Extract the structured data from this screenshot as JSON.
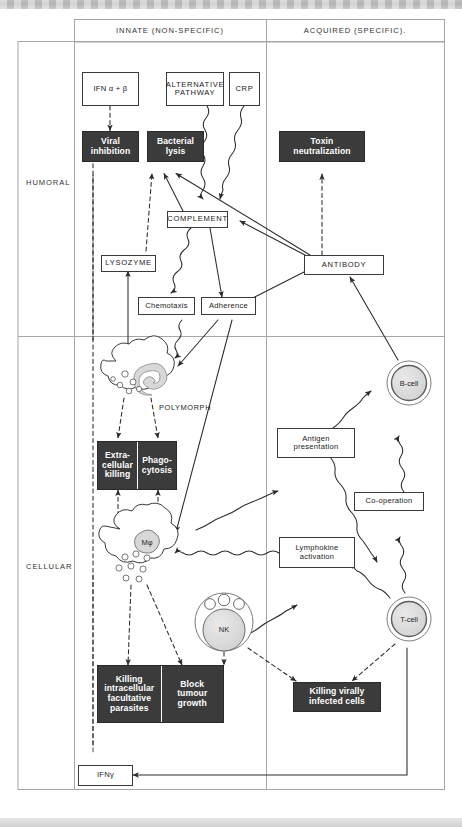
{
  "figure": {
    "type": "immunology-flow-diagram",
    "columns": [
      {
        "id": "innate",
        "label": "INNATE (NON-SPECIFIC)"
      },
      {
        "id": "acquired",
        "label": "ACQUIRED (SPECIFIC)."
      }
    ],
    "rows": [
      {
        "id": "humoral",
        "label": "HUMORAL"
      },
      {
        "id": "cellular",
        "label": "CELLULAR"
      }
    ],
    "colors": {
      "effector_fill": "#3b3b3b",
      "effector_text": "#ffffff",
      "mediator_fill": "#ffffff",
      "stroke": "#3a3a3a",
      "frame": "#9a9a9a",
      "cell_nucleus": "#d8d8d8"
    },
    "legend_note": {
      "solid_arrow": "activation / direct action",
      "dashed_arrow": "effector action",
      "wavy_arrow": "soluble mediator"
    },
    "nodes": {
      "ifn_ab": {
        "label": "IFN α + β",
        "style": "open",
        "compartment": "innate-humoral"
      },
      "alt_pathway": {
        "label": "ALTERNATIVE\nPATHWAY",
        "style": "open",
        "compartment": "innate-humoral"
      },
      "crp": {
        "label": "CRP",
        "style": "open",
        "compartment": "innate-humoral"
      },
      "viral_inhib": {
        "label": "Viral\ninhibition",
        "style": "solid",
        "compartment": "innate-humoral"
      },
      "bacterial_lysis": {
        "label": "Bacterial\nlysis",
        "style": "solid",
        "compartment": "innate-humoral"
      },
      "toxin_neut": {
        "label": "Toxin\nneutralization",
        "style": "solid",
        "compartment": "acquired-humoral"
      },
      "complement": {
        "label": "COMPLEMENT",
        "style": "open",
        "compartment": "innate-humoral"
      },
      "lysozyme": {
        "label": "LYSOZYME",
        "style": "open",
        "compartment": "innate-humoral"
      },
      "chemotaxis": {
        "label": "Chemotaxis",
        "style": "open",
        "compartment": "innate-humoral"
      },
      "adherence": {
        "label": "Adherence",
        "style": "open",
        "compartment": "innate-humoral"
      },
      "antibody": {
        "label": "ANTIBODY",
        "style": "open",
        "compartment": "acquired-humoral"
      },
      "polymorph": {
        "label": "POLYMORPH",
        "style": "cell",
        "compartment": "innate-cellular"
      },
      "macrophage": {
        "label": "Mφ",
        "style": "cell",
        "compartment": "innate-cellular"
      },
      "nk": {
        "label": "NK",
        "style": "cell",
        "compartment": "innate-cellular"
      },
      "bcell": {
        "label": "B-cell",
        "style": "cell",
        "compartment": "acquired-cellular"
      },
      "tcell": {
        "label": "T-cell",
        "style": "cell",
        "compartment": "acquired-cellular"
      },
      "extra_phago": {
        "label_left": "Extra-\ncellular\nkilling",
        "label_right": "Phago-\ncytosis",
        "style": "solid-pair",
        "compartment": "innate-cellular"
      },
      "killing_block": {
        "label_left": "Killing\nintracellular\nfacultative\nparasites",
        "label_right": "Block\ntumour\ngrowth",
        "style": "solid-pair",
        "compartment": "innate-cellular"
      },
      "antigen_pres": {
        "label": "Antigen\npresentation",
        "style": "open",
        "compartment": "acquired-cellular"
      },
      "cooperation": {
        "label": "Co-operation",
        "style": "open",
        "compartment": "acquired-cellular"
      },
      "lymphokine": {
        "label": "Lymphokine\nactivation",
        "style": "open",
        "compartment": "acquired-cellular"
      },
      "killing_viral": {
        "label": "Killing virally\ninfected cells",
        "style": "solid",
        "compartment": "acquired-cellular"
      },
      "ifn_gamma": {
        "label": "IFNγ",
        "style": "open",
        "compartment": "innate-cellular"
      }
    },
    "edges": [
      {
        "from": "ifn_ab",
        "to": "viral_inhib",
        "kind": "dashed"
      },
      {
        "from": "alt_pathway",
        "to": "complement",
        "kind": "wavy"
      },
      {
        "from": "crp",
        "to": "complement",
        "kind": "wavy"
      },
      {
        "from": "complement",
        "to": "bacterial_lysis",
        "kind": "solid"
      },
      {
        "from": "complement",
        "to": "chemotaxis",
        "kind": "wavy"
      },
      {
        "from": "complement",
        "to": "adherence",
        "kind": "solid"
      },
      {
        "from": "antibody",
        "to": "complement",
        "kind": "solid"
      },
      {
        "from": "antibody",
        "to": "adherence",
        "kind": "solid"
      },
      {
        "from": "antibody",
        "to": "toxin_neut",
        "kind": "dashed"
      },
      {
        "from": "antibody",
        "to": "bacterial_lysis",
        "kind": "solid"
      },
      {
        "from": "lysozyme",
        "to": "bacterial_lysis",
        "kind": "dashed"
      },
      {
        "from": "polymorph",
        "to": "lysozyme",
        "kind": "solid"
      },
      {
        "from": "chemotaxis",
        "to": "polymorph",
        "kind": "wavy"
      },
      {
        "from": "adherence",
        "to": "polymorph",
        "kind": "solid"
      },
      {
        "from": "adherence",
        "to": "macrophage",
        "kind": "solid"
      },
      {
        "from": "polymorph",
        "to": "extra_phago",
        "kind": "dashed"
      },
      {
        "from": "extra_phago",
        "to": "macrophage",
        "kind": "dashed"
      },
      {
        "from": "macrophage",
        "to": "killing_block",
        "kind": "dashed"
      },
      {
        "from": "macrophage",
        "to": "antigen_pres",
        "kind": "wavy"
      },
      {
        "from": "antigen_pres",
        "to": "bcell",
        "kind": "wavy"
      },
      {
        "from": "antigen_pres",
        "to": "tcell",
        "kind": "wavy"
      },
      {
        "from": "bcell",
        "to": "antibody",
        "kind": "solid"
      },
      {
        "from": "cooperation",
        "to": "bcell",
        "kind": "wavy"
      },
      {
        "from": "tcell",
        "to": "cooperation",
        "kind": "wavy"
      },
      {
        "from": "lymphokine",
        "to": "macrophage",
        "kind": "wavy"
      },
      {
        "from": "tcell",
        "to": "lymphokine",
        "kind": "wavy"
      },
      {
        "from": "nk",
        "to": "lymphokine",
        "kind": "wavy"
      },
      {
        "from": "nk",
        "to": "killing_block",
        "kind": "dashed"
      },
      {
        "from": "nk",
        "to": "killing_viral",
        "kind": "dashed"
      },
      {
        "from": "tcell",
        "to": "killing_viral",
        "kind": "dashed"
      },
      {
        "from": "tcell",
        "to": "ifn_gamma",
        "kind": "solid"
      },
      {
        "from": "ifn_gamma",
        "to": "viral_inhib",
        "kind": "dashed"
      }
    ]
  }
}
